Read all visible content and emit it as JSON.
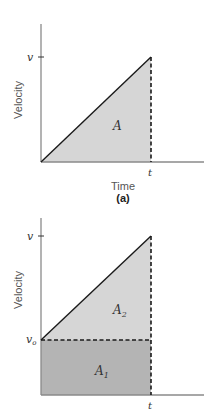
{
  "colors": {
    "fill_light": "#d6d6d6",
    "fill_dark": "#b4b4b4",
    "line": "#1a1a1a",
    "axis": "#8a8a8a"
  },
  "figure_a": {
    "ylabel": "Velocity",
    "xlabel": "Time",
    "caption": "(a)",
    "y_tick_label": "v",
    "x_tick_label": "t",
    "area_label": "A"
  },
  "figure_b": {
    "ylabel": "Velocity",
    "y_tick_top_label": "v",
    "y_tick_base_label": "v",
    "y_tick_base_sub": "o",
    "x_tick_label": "t",
    "area_upper_label": "A",
    "area_upper_sub": "2",
    "area_lower_label": "A",
    "area_lower_sub": "1"
  }
}
